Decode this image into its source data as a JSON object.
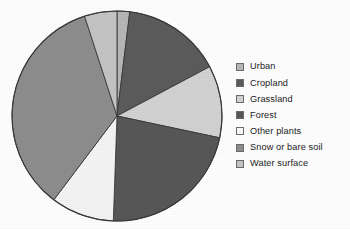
{
  "chart_data": {
    "type": "pie",
    "title": "",
    "subtitle": "",
    "xlabel": "",
    "ylabel": "",
    "grid": false,
    "legend_position": "right",
    "start_angle_deg": 0,
    "direction": "clockwise",
    "categories": [
      "Urban",
      "Cropland",
      "Grassland",
      "Forest",
      "Other plants",
      "Snow or bare soil",
      "Water surface"
    ],
    "values": [
      1.9,
      15.3,
      11.1,
      22.2,
      9.7,
      34.7,
      5.1
    ],
    "angles_deg": [
      7,
      55,
      40,
      80,
      35,
      125,
      18
    ],
    "colors": [
      "#b6b6b6",
      "#5b5b5b",
      "#d2d2d2",
      "#575757",
      "#f4f4f4",
      "#8d8d8d",
      "#c4c4c4"
    ],
    "slices": [
      {
        "label": "Urban",
        "value": 1.9,
        "angle_deg": 7,
        "color": "#b6b6b6"
      },
      {
        "label": "Cropland",
        "value": 15.3,
        "angle_deg": 55,
        "color": "#5b5b5b"
      },
      {
        "label": "Grassland",
        "value": 11.1,
        "angle_deg": 40,
        "color": "#d2d2d2"
      },
      {
        "label": "Forest",
        "value": 22.2,
        "angle_deg": 80,
        "color": "#575757"
      },
      {
        "label": "Other plants",
        "value": 9.7,
        "angle_deg": 35,
        "color": "#f4f4f4"
      },
      {
        "label": "Snow or bare soil",
        "value": 34.7,
        "angle_deg": 125,
        "color": "#8d8d8d"
      },
      {
        "label": "Water surface",
        "value": 5.1,
        "angle_deg": 18,
        "color": "#c4c4c4"
      }
    ]
  },
  "legend": {
    "items": [
      {
        "label": "Urban",
        "color": "#b6b6b6"
      },
      {
        "label": "Cropland",
        "color": "#5b5b5b"
      },
      {
        "label": "Grassland",
        "color": "#d2d2d2"
      },
      {
        "label": "Forest",
        "color": "#575757"
      },
      {
        "label": "Other plants",
        "color": "#fbfbfb"
      },
      {
        "label": "Snow or bare soil",
        "color": "#8d8d8d"
      },
      {
        "label": "Water surface",
        "color": "#c4c4c4"
      }
    ]
  },
  "geometry": {
    "center_x": 117,
    "center_y": 116,
    "radius": 105,
    "outline_color": "#3a3a3a"
  }
}
